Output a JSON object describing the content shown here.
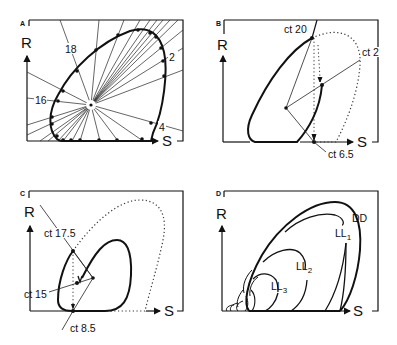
{
  "panels": {
    "A": {
      "label": "A",
      "y_axis": "R",
      "x_axis": "S",
      "ray_labels": [
        "18",
        "2",
        "16",
        "4"
      ]
    },
    "B": {
      "label": "B",
      "y_axis": "R",
      "x_axis": "S",
      "annotations": [
        "ct 20",
        "ct 2",
        "ct 6.5"
      ]
    },
    "C": {
      "label": "C",
      "y_axis": "R",
      "x_axis": "S",
      "annotations": [
        "ct 17.5",
        "ct 15",
        "ct 8.5"
      ]
    },
    "D": {
      "label": "D",
      "y_axis": "R",
      "x_axis": "S",
      "curve_labels": {
        "dd": "DD",
        "ll1_main": "LL",
        "ll1_sub": "1",
        "ll2_main": "LL",
        "ll2_sub": "2",
        "ll3_main": "LL",
        "ll3_sub": "3"
      }
    }
  }
}
